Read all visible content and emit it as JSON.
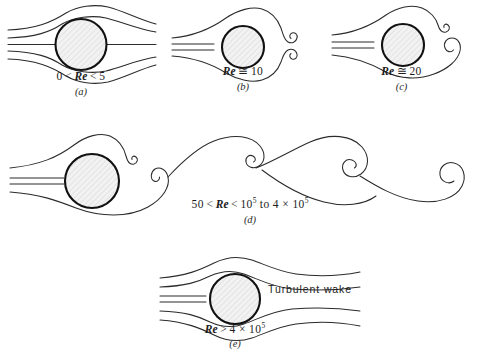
{
  "figure": {
    "background_color": "#ffffff",
    "line_color": "#2b2b2b",
    "cylinder_outline_color": "#111111",
    "cylinder_fill_color": "#f0f0f0"
  },
  "panels": [
    {
      "id": "a",
      "letter": "(a)",
      "regime": "creeping-flow-no-separation",
      "caption": {
        "prefix": "0",
        "op1": "<",
        "symbol": "Re",
        "op2": "<",
        "value": "5",
        "exponent": "",
        "suffix": ""
      },
      "caption_plain": "0 < Re < 5",
      "description": "Symmetric streamlines, no wake separation"
    },
    {
      "id": "b",
      "letter": "(b)",
      "regime": "fixed-symmetric-eddies",
      "caption": {
        "prefix": "",
        "op1": "",
        "symbol": "Re",
        "op2": "≅",
        "value": "10",
        "exponent": "",
        "suffix": ""
      },
      "caption_plain": "Re ≅ 10",
      "description": "A pair of fixed symmetric attached eddies behind cylinder"
    },
    {
      "id": "c",
      "letter": "(c)",
      "regime": "asymmetric-eddies-onset",
      "caption": {
        "prefix": "",
        "op1": "",
        "symbol": "Re",
        "op2": "≅",
        "value": "20",
        "exponent": "",
        "suffix": ""
      },
      "caption_plain": "Re ≅ 20",
      "description": "Asymmetric eddies, onset of wake instability"
    },
    {
      "id": "d",
      "letter": "(d)",
      "regime": "karman-vortex-street",
      "caption": {
        "prefix": "50",
        "op1": "<",
        "symbol": "Re",
        "op2": "<",
        "value": "10",
        "exponent": "5",
        "suffix": "to 4 × 10",
        "suffix_exponent": "5"
      },
      "caption_plain": "50 < Re < 10⁵ to 4 × 10⁵",
      "description": "Periodic Karman vortex street of alternating shed vortices"
    },
    {
      "id": "e",
      "letter": "(e)",
      "regime": "turbulent-wake",
      "caption": {
        "prefix": "",
        "op1": "",
        "symbol": "Re",
        "op2": ">",
        "value": "4 × 10",
        "exponent": "5",
        "suffix": ""
      },
      "caption_plain": "Re > 4 × 10⁵",
      "annotation": "Turbulent wake",
      "description": "Narrow turbulent wake after boundary-layer transition"
    }
  ]
}
